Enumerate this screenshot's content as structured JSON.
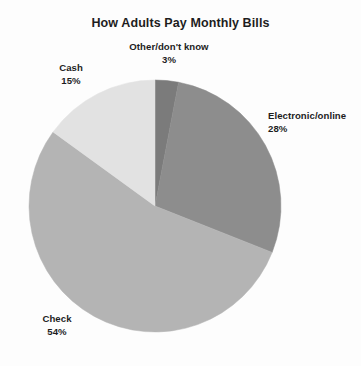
{
  "chart_data": {
    "type": "pie",
    "title": "How Adults Pay Monthly Bills",
    "xlabel": "",
    "ylabel": "",
    "legend_position": "none",
    "grid": false,
    "units": "percent",
    "start_angle_deg": 0,
    "direction": "clockwise",
    "categories": [
      "Other/don't know",
      "Electronic/online",
      "Check",
      "Cash"
    ],
    "values": [
      3,
      28,
      54,
      15
    ],
    "labels": [
      "3%",
      "28%",
      "54%",
      "15%"
    ],
    "slices": [
      {
        "name": "Other/don't know",
        "value": 3,
        "label": "3%",
        "color": "#7b7b7b",
        "start_deg": 0,
        "end_deg": 10.8
      },
      {
        "name": "Electronic/online",
        "value": 28,
        "label": "28%",
        "color": "#8d8d8d",
        "start_deg": 10.8,
        "end_deg": 111.6
      },
      {
        "name": "Check",
        "value": 54,
        "label": "54%",
        "color": "#b4b4b4",
        "start_deg": 111.6,
        "end_deg": 306.0
      },
      {
        "name": "Cash",
        "value": 15,
        "label": "15%",
        "color": "#e2e2e2",
        "start_deg": 306.0,
        "end_deg": 360.0
      }
    ],
    "colors": {
      "other": "#7b7b7b",
      "electronic": "#8d8d8d",
      "check": "#b4b4b4",
      "cash": "#e2e2e2",
      "background": "#fdfdfd",
      "text": "#1d1d1d"
    }
  },
  "geometry": {
    "center_x": 155,
    "center_y": 206,
    "radius": 126
  }
}
